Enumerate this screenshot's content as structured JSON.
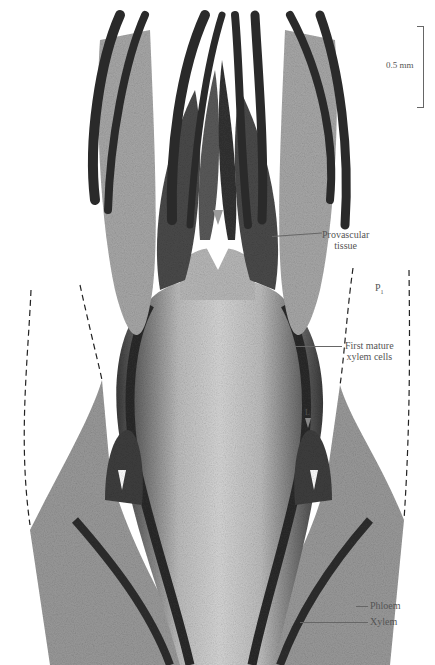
{
  "figure": {
    "scale_bar": {
      "label": "0.5 mm"
    },
    "labels": {
      "provascular": [
        "Provascular",
        "tissue"
      ],
      "p1": "P",
      "p1_sub": "1",
      "first_mature": [
        "First mature",
        "xylem cells"
      ],
      "leaf_marker": "L",
      "phloem": "Phloem",
      "xylem": "Xylem"
    },
    "colors": {
      "background": "#ffffff",
      "tissue_dark": "#2a2a2a",
      "tissue_mid": "#8a8a8a",
      "tissue_light": "#c8c8c8",
      "label_text": "#555555",
      "arrow_marker": "#9a9a9a"
    }
  }
}
